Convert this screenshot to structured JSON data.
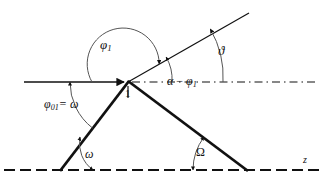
{
  "figure": {
    "type": "optics-ray-geometry-diagram",
    "background_color": "#ffffff",
    "stroke_color": "#111111",
    "title": ""
  },
  "labels": {
    "phi1": "φ",
    "phi1_sub": "1",
    "phi01": "φ",
    "phi01_sub": "01",
    "phi01_eq": "= ω",
    "alpha_minus_phi1_a": "α",
    "alpha_minus_phi1_op": " − ",
    "alpha_minus_phi1_b": "φ",
    "alpha_minus_phi1_sub": "1",
    "vartheta": "ϑ",
    "omega_bottom": "ω",
    "Omega_bottom": "Ω",
    "z_axis": "z",
    "point_one": "1"
  },
  "geometry": {
    "vertex": {
      "x": 128,
      "y": 82,
      "name": "point-1"
    },
    "incoming_ray": {
      "x1": 24,
      "y1": 82,
      "x2": 126,
      "y2": 82,
      "arrow": "end",
      "style": "solid",
      "width": 1.6
    },
    "dashed_axis_upper": {
      "x1": 131,
      "y1": 82,
      "x2": 316,
      "y2": 82,
      "style": "dash-dot"
    },
    "outgoing_ray_up": {
      "x1": 128,
      "y1": 82,
      "x2": 249,
      "y2": 13,
      "style": "solid",
      "width": 1.2
    },
    "lower_left_line": {
      "x1": 128,
      "y1": 82,
      "x2": 60,
      "y2": 170,
      "style": "solid",
      "width": 2.6
    },
    "lower_right_line": {
      "x1": 128,
      "y1": 82,
      "x2": 248,
      "y2": 170,
      "style": "solid",
      "width": 2.6
    },
    "dashed_axis_bottom": {
      "x1": 4,
      "y1": 170,
      "x2": 320,
      "y2": 170,
      "style": "dash",
      "label": "z"
    },
    "arcs": [
      {
        "name": "phi1-arc",
        "cx": 128,
        "cy": 82,
        "r": 36,
        "from_deg": 180,
        "to_deg": 30,
        "direction": "ccw"
      },
      {
        "name": "phi01-arc",
        "cx": 128,
        "cy": 82,
        "r": 58,
        "from_deg": 180,
        "to_deg": 232,
        "direction": "cw"
      },
      {
        "name": "alpha-minus-phi1-arc",
        "cx": 128,
        "cy": 82,
        "r": 44,
        "from_deg": 0,
        "to_deg": 30
      },
      {
        "name": "vartheta-arc",
        "cx": 128,
        "cy": 82,
        "r": 95,
        "from_deg": 0,
        "to_deg": 30
      },
      {
        "name": "omega-bottom-arc",
        "cx": 60,
        "cy": 170,
        "r": 33,
        "from_deg": 0,
        "to_deg": 52
      },
      {
        "name": "Omega-bottom-arc",
        "cx": 248,
        "cy": 170,
        "r": 55,
        "from_deg": 180,
        "to_deg": 144
      }
    ]
  }
}
